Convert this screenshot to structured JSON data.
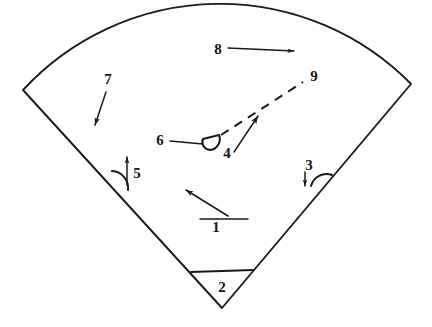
{
  "figure": {
    "type": "patent-line-drawing",
    "background_color": "#ffffff",
    "line_color": "#1a1a1a",
    "width": 432,
    "height": 327,
    "reference_labels": [
      {
        "id": "1",
        "text": "1",
        "x": 216,
        "y": 232,
        "callout": "underline-with-diagonal-arrow"
      },
      {
        "id": "2",
        "text": "2",
        "x": 222,
        "y": 292,
        "callout": "chord-triangle"
      },
      {
        "id": "3",
        "text": "3",
        "x": 309,
        "y": 170,
        "callout": "down-arrow-with-angle-arc"
      },
      {
        "id": "4",
        "text": "4",
        "x": 227,
        "y": 158,
        "callout": "diagonal-arrow-to-dashed-line"
      },
      {
        "id": "5",
        "text": "5",
        "x": 137,
        "y": 178,
        "callout": "up-arrow-with-angle-arc"
      },
      {
        "id": "6",
        "text": "6",
        "x": 160,
        "y": 145,
        "callout": "horizontal-leader-to-hook"
      },
      {
        "id": "7",
        "text": "7",
        "x": 108,
        "y": 84,
        "callout": "diagonal-arrow-down-left"
      },
      {
        "id": "8",
        "text": "8",
        "x": 218,
        "y": 54,
        "callout": "horizontal-arrow-right"
      },
      {
        "id": "9",
        "text": "9",
        "x": 314,
        "y": 81,
        "callout": "dashed-direction-line"
      }
    ],
    "geometry": {
      "sector_apex": {
        "x": 222,
        "y": 308
      },
      "arc_left_corner": {
        "x": 23,
        "y": 90
      },
      "arc_right_corner": {
        "x": 411,
        "y": 84
      },
      "arc_top": {
        "x": 215,
        "y": 14
      },
      "chord_left": {
        "x": 191,
        "y": 272
      },
      "chord_right": {
        "x": 253,
        "y": 270
      },
      "angle_arc_left_vertex": {
        "x": 118,
        "y": 180
      },
      "angle_arc_right_vertex": {
        "x": 326,
        "y": 182
      },
      "hook_center": {
        "x": 212,
        "y": 141
      },
      "dashed_start": {
        "x": 222,
        "y": 134
      },
      "dashed_end": {
        "x": 303,
        "y": 82
      }
    }
  }
}
